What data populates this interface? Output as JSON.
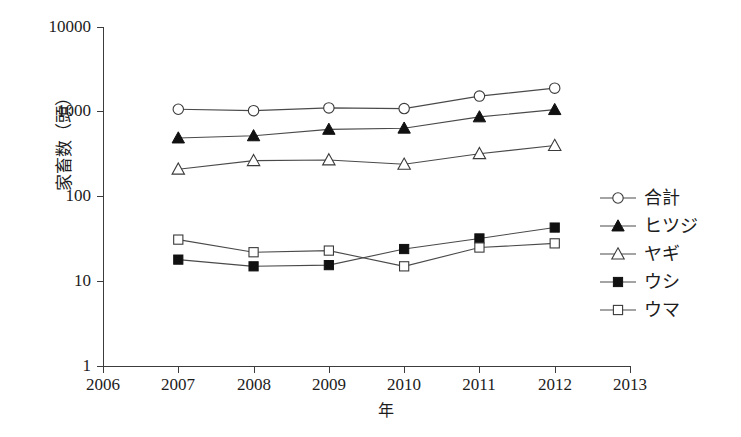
{
  "chart_data": {
    "type": "line",
    "title": "",
    "xlabel": "年",
    "ylabel": "家畜数（頭）",
    "x": [
      2007,
      2008,
      2009,
      2010,
      2011,
      2012
    ],
    "xlim": [
      2006,
      2013
    ],
    "ylim": [
      1,
      10000
    ],
    "yscale": "log",
    "grid": false,
    "legend_position": "right",
    "x_tick_labels": [
      "2006",
      "2007",
      "2008",
      "2009",
      "2010",
      "2011",
      "2012",
      "2013"
    ],
    "y_tick_labels": [
      "10000",
      "1000",
      "100",
      "10",
      "1"
    ],
    "series": [
      {
        "name": "合計",
        "marker": "circle-open",
        "values": [
          1070,
          1030,
          1110,
          1090,
          1530,
          1900
        ]
      },
      {
        "name": "ヒツジ",
        "marker": "triangle-filled",
        "values": [
          490,
          520,
          620,
          640,
          870,
          1060
        ]
      },
      {
        "name": "ヤギ",
        "marker": "triangle-open",
        "values": [
          210,
          265,
          270,
          240,
          320,
          400
        ]
      },
      {
        "name": "ウシ",
        "marker": "square-filled",
        "values": [
          18,
          15,
          15.5,
          24,
          32,
          43
        ]
      },
      {
        "name": "ウマ",
        "marker": "square-open",
        "values": [
          31,
          22,
          23,
          15,
          25,
          28
        ]
      }
    ]
  },
  "axes": {
    "y_title": "家畜数（頭）",
    "x_title": "年",
    "y_ticks": [
      {
        "label": "10000",
        "top": 27
      },
      {
        "label": "1000",
        "top": 111
      },
      {
        "label": "100",
        "top": 196
      },
      {
        "label": "10",
        "top": 281
      },
      {
        "label": "1",
        "top": 366
      }
    ],
    "x_ticks": [
      {
        "label": "2006",
        "left": 103
      },
      {
        "label": "2007",
        "left": 178
      },
      {
        "label": "2008",
        "left": 254
      },
      {
        "label": "2009",
        "left": 329
      },
      {
        "label": "2010",
        "left": 404
      },
      {
        "label": "2011",
        "left": 479
      },
      {
        "label": "2012",
        "left": 555
      },
      {
        "label": "2013",
        "left": 630
      }
    ]
  },
  "legend": {
    "items": [
      {
        "label": "合計",
        "marker": "circle-open"
      },
      {
        "label": "ヒツジ",
        "marker": "triangle-filled"
      },
      {
        "label": "ヤギ",
        "marker": "triangle-open"
      },
      {
        "label": "ウシ",
        "marker": "square-filled"
      },
      {
        "label": "ウマ",
        "marker": "square-open"
      }
    ]
  }
}
